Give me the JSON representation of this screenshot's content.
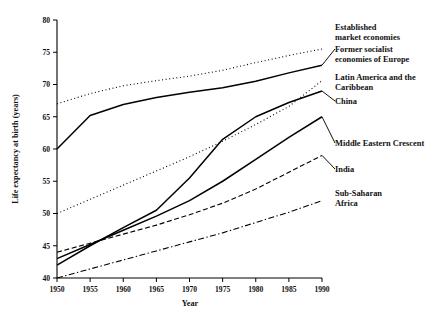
{
  "chart_data": {
    "type": "line",
    "title": "",
    "xlabel": "Year",
    "ylabel": "Life expectancy at birth (years)",
    "x": [
      1950,
      1955,
      1960,
      1965,
      1970,
      1975,
      1980,
      1985,
      1990
    ],
    "xlim": [
      1950,
      1990
    ],
    "ylim": [
      40,
      80
    ],
    "xticks": [
      "1950",
      "1955",
      "1960",
      "1965",
      "1970",
      "1975",
      "1980",
      "1985",
      "1990"
    ],
    "yticks": [
      "40",
      "45",
      "50",
      "55",
      "60",
      "65",
      "70",
      "75",
      "80"
    ],
    "grid": false,
    "legend_position": "right-inline-labels",
    "series": [
      {
        "name": "Established market economies",
        "label_lines": [
          "Established",
          "market economies"
        ],
        "style": "dotted",
        "values": [
          67.0,
          68.6,
          69.8,
          70.6,
          71.3,
          72.2,
          73.4,
          74.5,
          75.5
        ]
      },
      {
        "name": "Former socialist economies of Europe",
        "label_lines": [
          "Former socialist",
          "economies of Europe"
        ],
        "style": "solid",
        "values": [
          60.0,
          65.2,
          66.9,
          68.0,
          68.8,
          69.5,
          70.5,
          71.8,
          73.0
        ]
      },
      {
        "name": "Latin America and the Caribbean",
        "label_lines": [
          "Latin America and the",
          "Caribbean"
        ],
        "style": "dotted",
        "values": [
          50.0,
          52.2,
          54.4,
          56.6,
          58.8,
          61.2,
          63.8,
          66.6,
          70.6
        ]
      },
      {
        "name": "China",
        "label_lines": [
          "China"
        ],
        "style": "solid",
        "values": [
          42.0,
          45.0,
          47.8,
          50.5,
          55.5,
          61.5,
          65.0,
          67.2,
          69.0
        ]
      },
      {
        "name": "Middle Eastern Crescent",
        "label_lines": [
          "Middle Eastern Crescent"
        ],
        "style": "solid",
        "values": [
          43.0,
          45.2,
          47.4,
          49.6,
          52.0,
          55.0,
          58.4,
          61.8,
          65.0
        ]
      },
      {
        "name": "India",
        "label_lines": [
          "India"
        ],
        "style": "dashed",
        "values": [
          44.0,
          45.4,
          46.8,
          48.2,
          49.8,
          51.6,
          53.8,
          56.4,
          59.0
        ]
      },
      {
        "name": "Sub-Saharan Africa",
        "label_lines": [
          "Sub-Saharan",
          "Africa"
        ],
        "style": "dashdot",
        "values": [
          40.0,
          41.4,
          42.8,
          44.2,
          45.6,
          47.0,
          48.6,
          50.2,
          52.0
        ]
      }
    ]
  }
}
